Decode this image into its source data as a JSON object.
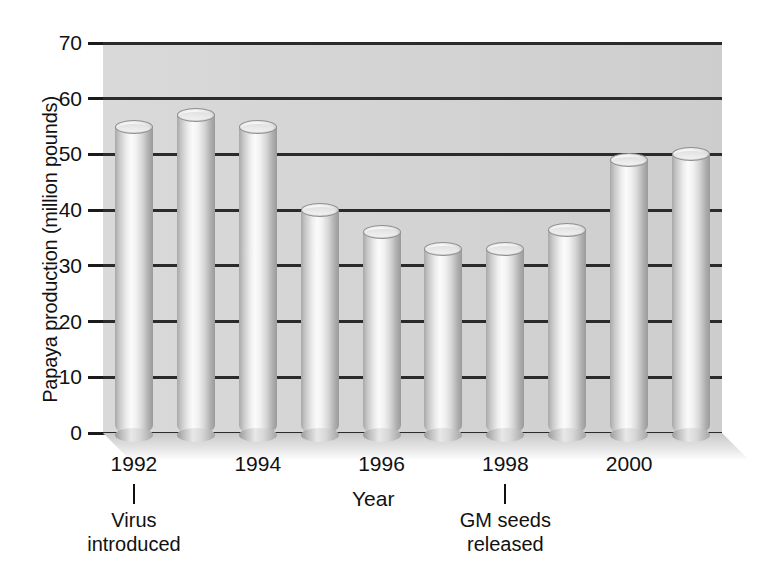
{
  "chart_data": {
    "type": "bar",
    "title": "",
    "xlabel": "Year",
    "ylabel": "Papaya production (million pounds)",
    "ylim": [
      0,
      70
    ],
    "ytick_labels": [
      "70",
      "60",
      "50",
      "40",
      "30",
      "20",
      "10",
      "0"
    ],
    "ytick_values": [
      70,
      60,
      50,
      40,
      30,
      20,
      10,
      0
    ],
    "grid": true,
    "legend": null,
    "categories": [
      "1992",
      "1993",
      "1994",
      "1995",
      "1996",
      "1997",
      "1998",
      "1999",
      "2000",
      "2001"
    ],
    "xtick_labels": [
      "1992",
      "1994",
      "1996",
      "1998",
      "2000"
    ],
    "values": [
      55,
      57,
      55,
      40,
      36,
      33,
      33,
      36.5,
      49,
      50
    ],
    "bar_style": "3d-cylinder",
    "annotations": [
      {
        "category": "1992",
        "line1": "Virus",
        "line2": "introduced"
      },
      {
        "category": "1998",
        "line1": "GM seeds",
        "line2": "released"
      }
    ]
  },
  "colors": {
    "plot_background": "#d5d5d5",
    "gridline": "#2b2b2b",
    "text": "#111111",
    "page_background": "#ffffff",
    "bar_light": "#fbfbfb",
    "bar_dark": "#9a9a9a"
  }
}
